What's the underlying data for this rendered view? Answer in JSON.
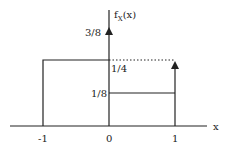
{
  "diagram": {
    "type": "probability-density-function",
    "y_axis_label": "f",
    "y_axis_label_sub": "X",
    "y_axis_label_arg": "(x)",
    "x_axis_label": "x",
    "x_ticks": [
      "-1",
      "0",
      "1"
    ],
    "y_labels": {
      "three_eighths": "3/8",
      "one_quarter": "1/4",
      "one_eighth": "1/8"
    },
    "segments": [
      {
        "from": -1,
        "to": 0,
        "height": "1/4"
      },
      {
        "from": 0,
        "to": 1,
        "height": "1/8"
      }
    ],
    "impulses": [
      {
        "at": 0,
        "weight": "3/8"
      },
      {
        "at": 1,
        "weight": "1/4"
      }
    ],
    "colors": {
      "line": "#222222",
      "background": "#ffffff"
    }
  }
}
